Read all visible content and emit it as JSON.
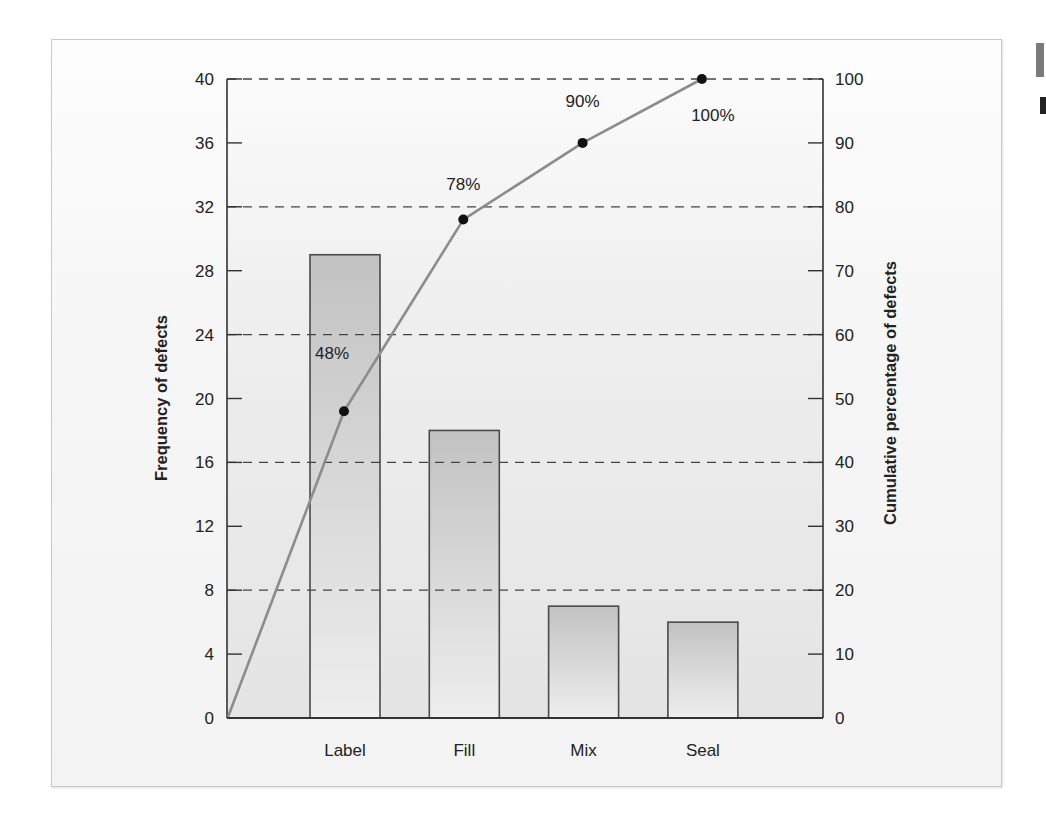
{
  "chart_data": {
    "type": "bar",
    "subtype": "pareto",
    "title": "",
    "categories": [
      "Label",
      "Fill",
      "Mix",
      "Seal"
    ],
    "series": [
      {
        "name": "Frequency of defects",
        "type": "bar",
        "axis": "left",
        "values": [
          29,
          18,
          7,
          6
        ]
      },
      {
        "name": "Cumulative percentage of defects",
        "type": "line",
        "axis": "right",
        "values": [
          48,
          78,
          90,
          100
        ],
        "start_at_origin": true
      }
    ],
    "point_labels": [
      "48%",
      "78%",
      "90%",
      "100%"
    ],
    "xlabel": "",
    "ylabel": "Frequency of defects",
    "ylabel_right": "Cumulative percentage of defects",
    "ylim": [
      0,
      40
    ],
    "ylim_right": [
      0,
      100
    ],
    "yticks": [
      0,
      4,
      8,
      12,
      16,
      20,
      24,
      28,
      32,
      36,
      40
    ],
    "yticks_right": [
      0,
      10,
      20,
      30,
      40,
      50,
      60,
      70,
      80,
      90,
      100
    ],
    "gridlines_dashed_at": [
      8,
      16,
      24,
      32,
      40
    ],
    "grid": true,
    "legend": "none"
  },
  "colors": {
    "bar_top": "#c2c2c2",
    "bar_bottom": "#eeeeee",
    "bar_outline": "#4a4a4a",
    "line": "#8c8c8c",
    "marker": "#111111",
    "grid": "#444444",
    "axis": "#333333"
  }
}
